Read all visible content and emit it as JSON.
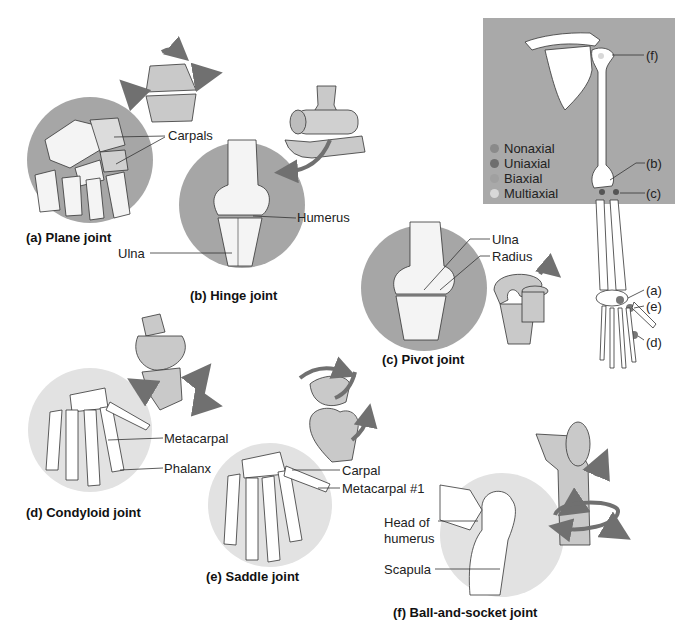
{
  "figure": {
    "panels": [
      {
        "id": "a",
        "caption": "(a)  Plane joint",
        "labels": [
          "Carpals"
        ]
      },
      {
        "id": "b",
        "caption": "(b)  Hinge joint",
        "labels": [
          "Humerus",
          "Ulna"
        ]
      },
      {
        "id": "c",
        "caption": "(c)  Pivot joint",
        "labels": [
          "Ulna",
          "Radius"
        ]
      },
      {
        "id": "d",
        "caption": "(d)  Condyloid joint",
        "labels": [
          "Metacarpal",
          "Phalanx"
        ]
      },
      {
        "id": "e",
        "caption": "(e)  Saddle joint",
        "labels": [
          "Carpal",
          "Metacarpal #1"
        ]
      },
      {
        "id": "f",
        "caption": "(f)  Ball-and-socket joint",
        "labels": [
          "Head of",
          "humerus",
          "Scapula"
        ]
      }
    ],
    "skeleton_key": {
      "legend": [
        {
          "label": "Nonaxial",
          "color": "#8a8a8a"
        },
        {
          "label": "Uniaxial",
          "color": "#6e6e6e"
        },
        {
          "label": "Biaxial",
          "color": "#a0a0a0"
        },
        {
          "label": "Multiaxial",
          "color": "#d8d8d8"
        }
      ],
      "markers": [
        "(f)",
        "(b)",
        "(c)",
        "(a)",
        "(e)",
        "(d)"
      ]
    },
    "colors": {
      "panel_bg": "#a9a9a9",
      "circle_dark": "#a6a6a6",
      "circle_light": "#e2e2e2",
      "model_fill": "#c9c9c9",
      "arrow": "#707070",
      "bone": "#ffffff"
    }
  }
}
